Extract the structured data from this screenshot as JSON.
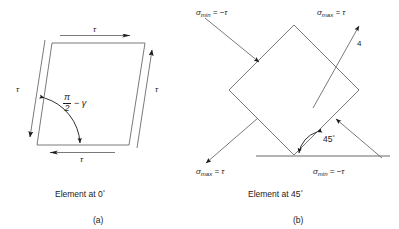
{
  "figure": {
    "background_color": "#ffffff",
    "stroke_color": "#1a1a1a",
    "line_color_light": "#6b6b6b"
  },
  "panel_a": {
    "letter": "(a)",
    "caption": "Element at 0",
    "caption_degree": "°",
    "shape": "parallelogram",
    "angle_label": {
      "numerator": "π",
      "denominator": "2",
      "rest": "− γ"
    },
    "shear_labels": [
      {
        "name": "tau-top",
        "text": "τ"
      },
      {
        "name": "tau-right",
        "text": "τ"
      },
      {
        "name": "tau-bottom",
        "text": "τ"
      },
      {
        "name": "tau-left",
        "text": "τ"
      }
    ]
  },
  "panel_b": {
    "letter": "(b)",
    "caption": "Element at 45",
    "caption_degree": "°",
    "shape": "diamond",
    "angle_label": "45",
    "angle_degree": "°",
    "point_label": "4",
    "stress_labels": [
      {
        "name": "sigma-min-top-left",
        "symbol": "σ",
        "subscript": "min",
        "value": "= −τ"
      },
      {
        "name": "sigma-max-top-right",
        "symbol": "σ",
        "subscript": "max",
        "value": "= τ"
      },
      {
        "name": "sigma-max-bottom-left",
        "symbol": "σ",
        "subscript": "max",
        "value": "= τ"
      },
      {
        "name": "sigma-min-bottom-right",
        "symbol": "σ",
        "subscript": "min",
        "value": "= −τ"
      }
    ]
  }
}
